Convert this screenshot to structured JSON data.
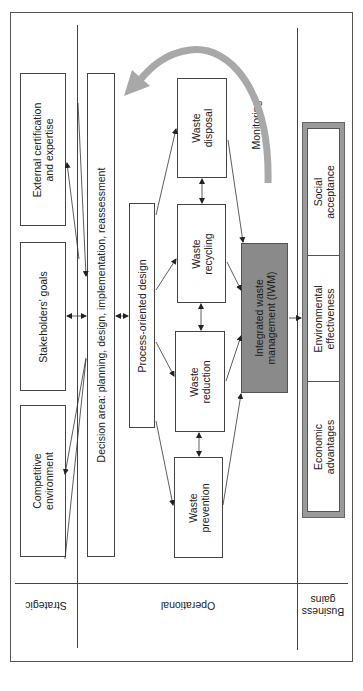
{
  "diagram": {
    "orientation": "rotated-90-ccw",
    "colors": {
      "line": "#444444",
      "iwm_fill": "#8a8a8a",
      "gains_frame": "#9a9a9a",
      "monitoring_arrow": "#a8a8a8",
      "background": "#ffffff"
    },
    "levels": [
      {
        "id": "strategic",
        "label": "Strategic"
      },
      {
        "id": "operational",
        "label": "Operational"
      },
      {
        "id": "business-gains",
        "label": "Business gains",
        "lines": [
          "Business",
          "gains"
        ]
      }
    ],
    "strategic": {
      "boxes": [
        {
          "id": "external",
          "lines": [
            "External certification",
            "and expertise"
          ]
        },
        {
          "id": "stakeholders",
          "lines": [
            "Stakeholders' goals"
          ]
        },
        {
          "id": "competitive",
          "lines": [
            "Competitive",
            "environment"
          ]
        }
      ]
    },
    "operational": {
      "decision_area": "Decision area: planning, design, implementation, reassessment",
      "process_design": "Process-oriented design",
      "waste_steps": [
        {
          "id": "disposal",
          "lines": [
            "Waste",
            "disposal"
          ]
        },
        {
          "id": "recycling",
          "lines": [
            "Waste",
            "recycling"
          ]
        },
        {
          "id": "reduction",
          "lines": [
            "Waste",
            "reduction"
          ]
        },
        {
          "id": "prevention",
          "lines": [
            "Waste",
            "prevention"
          ]
        }
      ],
      "iwm": {
        "lines": [
          "Integrated waste",
          "management (IWM)"
        ]
      },
      "monitoring": "Monitoring"
    },
    "business_gains": {
      "items": [
        {
          "id": "social",
          "lines": [
            "Social",
            "acceptance"
          ]
        },
        {
          "id": "environmental",
          "lines": [
            "Environmental",
            "effectiveness"
          ]
        },
        {
          "id": "economic",
          "lines": [
            "Economic",
            "advantages"
          ]
        }
      ]
    }
  }
}
